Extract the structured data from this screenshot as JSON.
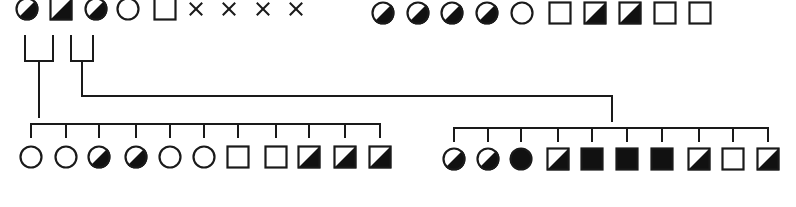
{
  "diagram": {
    "type": "pedigree",
    "colors": {
      "line": "#1a1a1a",
      "fill": "#111111",
      "background": "#ffffff"
    },
    "symbol_size": 23,
    "generation_1": {
      "left_group": {
        "y": 9,
        "members": [
          {
            "id": "I-1",
            "sex": "female",
            "status": "half",
            "x": 27
          },
          {
            "id": "I-2",
            "sex": "male",
            "status": "half",
            "x": 61
          },
          {
            "id": "I-3",
            "sex": "female",
            "status": "half",
            "x": 96
          },
          {
            "id": "I-4",
            "sex": "female",
            "status": "unaffected",
            "x": 128
          },
          {
            "id": "I-5",
            "sex": "male",
            "status": "unaffected",
            "x": 165
          },
          {
            "id": "I-6",
            "sex": "unknown",
            "status": "x-mark",
            "x": 196
          },
          {
            "id": "I-7",
            "sex": "unknown",
            "status": "x-mark",
            "x": 229
          },
          {
            "id": "I-8",
            "sex": "unknown",
            "status": "x-mark",
            "x": 263
          },
          {
            "id": "I-9",
            "sex": "unknown",
            "status": "x-mark",
            "x": 296
          }
        ]
      },
      "right_group": {
        "y": 13,
        "members": [
          {
            "id": "I-10",
            "sex": "female",
            "status": "half",
            "x": 383
          },
          {
            "id": "I-11",
            "sex": "female",
            "status": "half",
            "x": 418
          },
          {
            "id": "I-12",
            "sex": "female",
            "status": "half",
            "x": 452
          },
          {
            "id": "I-13",
            "sex": "female",
            "status": "half",
            "x": 487
          },
          {
            "id": "I-14",
            "sex": "female",
            "status": "unaffected",
            "x": 522
          },
          {
            "id": "I-15",
            "sex": "male",
            "status": "unaffected",
            "x": 560
          },
          {
            "id": "I-16",
            "sex": "male",
            "status": "half",
            "x": 595
          },
          {
            "id": "I-17",
            "sex": "male",
            "status": "half",
            "x": 630
          },
          {
            "id": "I-18",
            "sex": "male",
            "status": "unaffected",
            "x": 665
          },
          {
            "id": "I-19",
            "sex": "male",
            "status": "unaffected",
            "x": 700
          }
        ]
      }
    },
    "couples": [
      {
        "id": "couple-1",
        "left_x": 25,
        "right_x": 53,
        "top_y": 36,
        "bar_y": 61,
        "drop_x": 39
      },
      {
        "id": "couple-2",
        "left_x": 71,
        "right_x": 93,
        "top_y": 36,
        "bar_y": 61,
        "drop_x": 82
      }
    ],
    "connectors": {
      "couple_1_drop_end_y": 117,
      "couple_2_route": {
        "down_to_y": 96,
        "across_to_x": 612,
        "drop_to_y": 121
      }
    },
    "generation_2": {
      "left_sibship": {
        "line_y": 124,
        "tick_bottom_y": 137,
        "symbol_y": 157,
        "members": [
          {
            "id": "II-1",
            "sex": "female",
            "status": "unaffected",
            "x": 31
          },
          {
            "id": "II-2",
            "sex": "female",
            "status": "unaffected",
            "x": 66
          },
          {
            "id": "II-3",
            "sex": "female",
            "status": "half",
            "x": 99
          },
          {
            "id": "II-4",
            "sex": "female",
            "status": "half",
            "x": 136
          },
          {
            "id": "II-5",
            "sex": "female",
            "status": "unaffected",
            "x": 170
          },
          {
            "id": "II-6",
            "sex": "female",
            "status": "unaffected",
            "x": 204
          },
          {
            "id": "II-7",
            "sex": "male",
            "status": "unaffected",
            "x": 238
          },
          {
            "id": "II-8",
            "sex": "male",
            "status": "unaffected",
            "x": 276
          },
          {
            "id": "II-9",
            "sex": "male",
            "status": "half",
            "x": 309
          },
          {
            "id": "II-10",
            "sex": "male",
            "status": "half",
            "x": 345
          },
          {
            "id": "II-11",
            "sex": "male",
            "status": "half",
            "x": 380
          }
        ]
      },
      "right_sibship": {
        "line_y": 128,
        "tick_bottom_y": 141,
        "symbol_y": 159,
        "members": [
          {
            "id": "II-12",
            "sex": "female",
            "status": "half",
            "x": 454
          },
          {
            "id": "II-13",
            "sex": "female",
            "status": "half",
            "x": 488
          },
          {
            "id": "II-14",
            "sex": "female",
            "status": "affected",
            "x": 521
          },
          {
            "id": "II-15",
            "sex": "male",
            "status": "half",
            "x": 558
          },
          {
            "id": "II-16",
            "sex": "male",
            "status": "affected",
            "x": 592
          },
          {
            "id": "II-17",
            "sex": "male",
            "status": "affected",
            "x": 627
          },
          {
            "id": "II-18",
            "sex": "male",
            "status": "affected",
            "x": 662
          },
          {
            "id": "II-19",
            "sex": "male",
            "status": "half",
            "x": 699
          },
          {
            "id": "II-20",
            "sex": "male",
            "status": "unaffected",
            "x": 733
          },
          {
            "id": "II-21",
            "sex": "male",
            "status": "half",
            "x": 768
          }
        ]
      }
    }
  }
}
